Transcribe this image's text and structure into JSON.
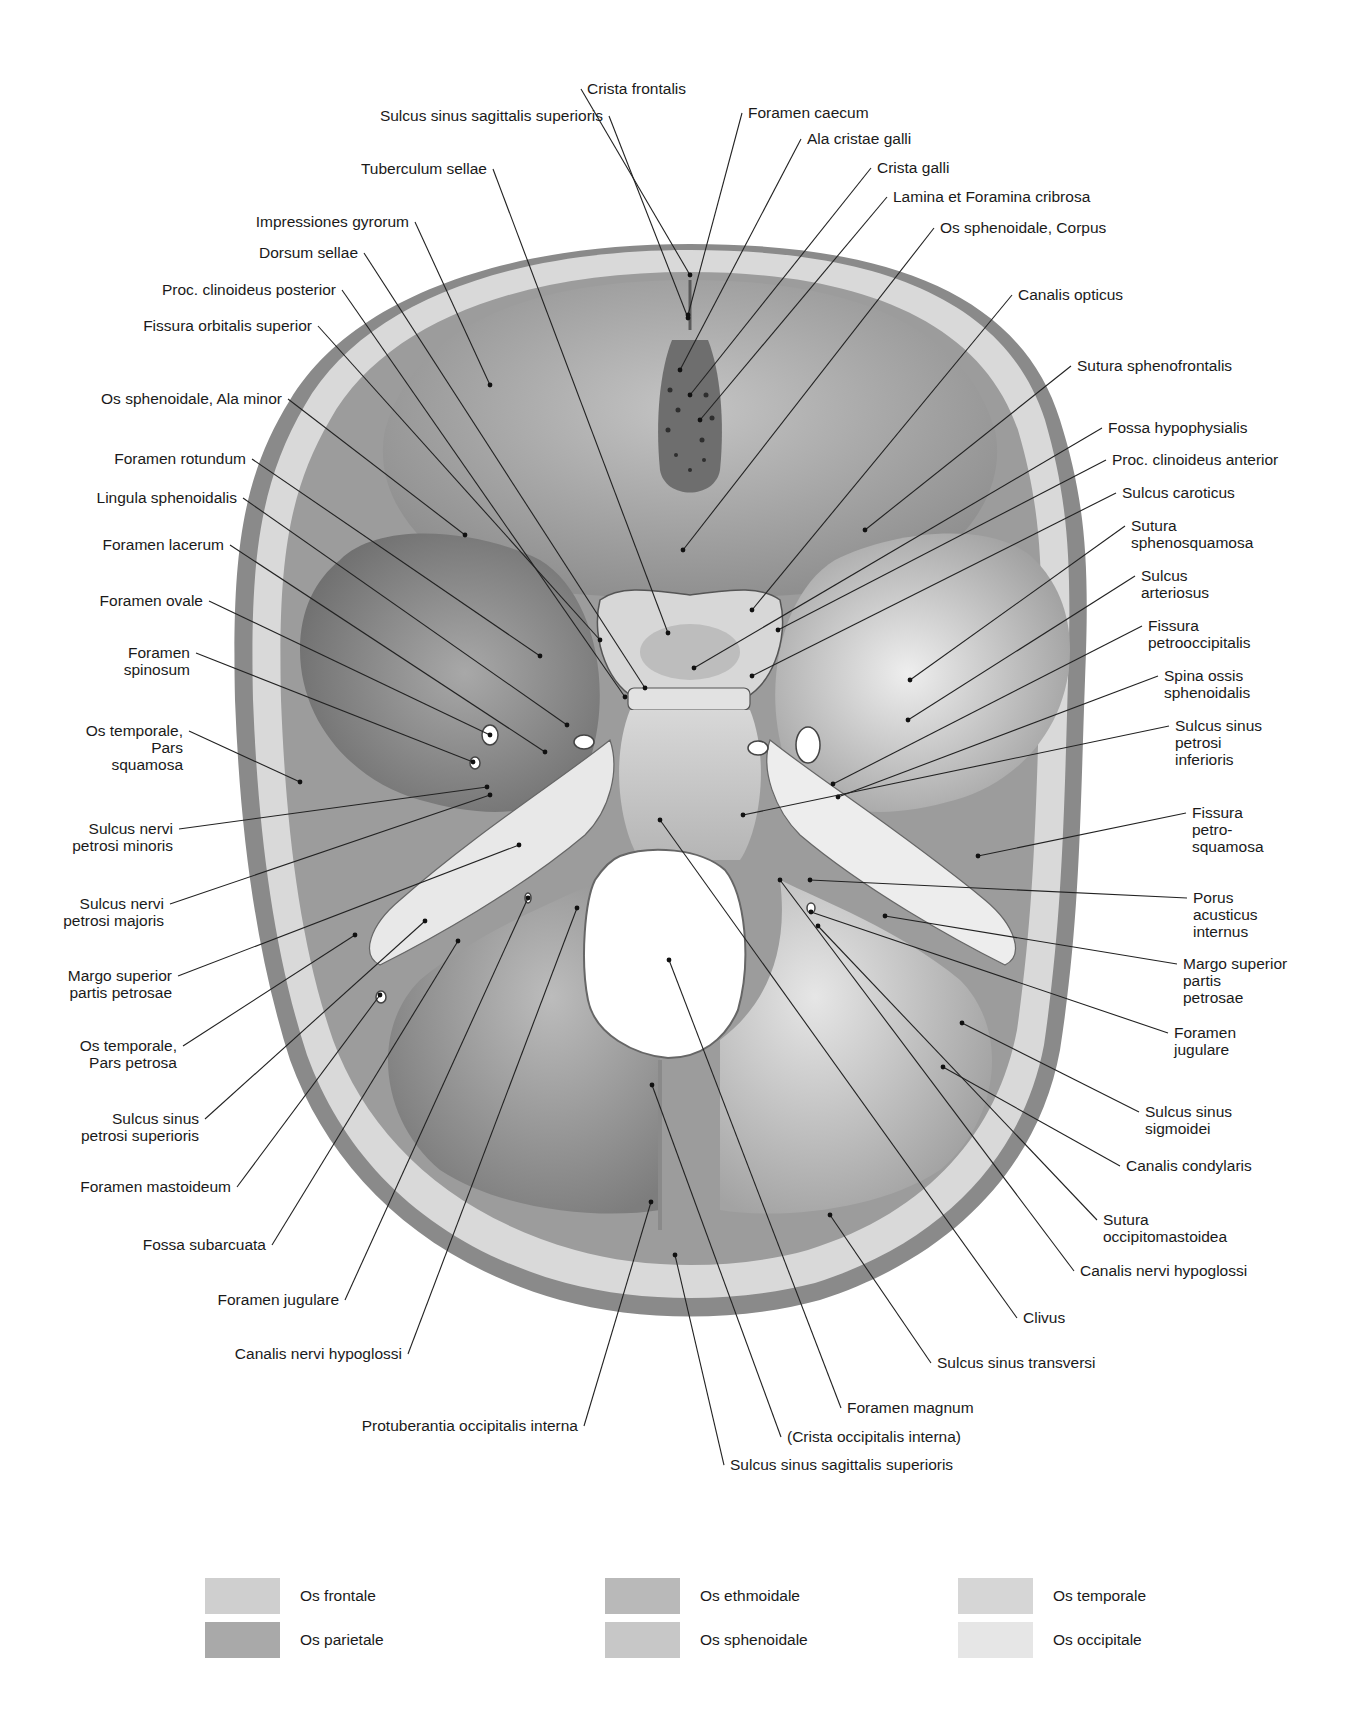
{
  "figure": {
    "labels_left": [
      {
        "id": "sulcus-sinus-sagittalis-superioris-top",
        "text": "Sulcus sinus sagittalis superioris",
        "x": 603,
        "y": 116,
        "tx": 688,
        "ty": 318
      },
      {
        "id": "tuberculum-sellae",
        "text": "Tuberculum sellae",
        "x": 487,
        "y": 169,
        "tx": 668,
        "ty": 633
      },
      {
        "id": "impressiones-gyrorum",
        "text": "Impressiones gyrorum",
        "x": 409,
        "y": 222,
        "tx": 490,
        "ty": 385
      },
      {
        "id": "dorsum-sellae",
        "text": "Dorsum sellae",
        "x": 358,
        "y": 253,
        "tx": 645,
        "ty": 688
      },
      {
        "id": "proc-clinoideus-posterior",
        "text": "Proc. clinoideus posterior",
        "x": 336,
        "y": 290,
        "tx": 625,
        "ty": 697
      },
      {
        "id": "fissura-orbitalis-superior",
        "text": "Fissura orbitalis superior",
        "x": 312,
        "y": 326,
        "tx": 600,
        "ty": 640
      },
      {
        "id": "os-sphenoidale-ala-minor",
        "text": "Os sphenoidale, Ala minor",
        "x": 282,
        "y": 399,
        "tx": 465,
        "ty": 535
      },
      {
        "id": "foramen-rotundum",
        "text": "Foramen rotundum",
        "x": 246,
        "y": 459,
        "tx": 540,
        "ty": 656
      },
      {
        "id": "lingula-sphenoidalis",
        "text": "Lingula sphenoidalis",
        "x": 237,
        "y": 498,
        "tx": 567,
        "ty": 725
      },
      {
        "id": "foramen-lacerum",
        "text": "Foramen lacerum",
        "x": 224,
        "y": 545,
        "tx": 545,
        "ty": 752
      },
      {
        "id": "foramen-ovale",
        "text": "Foramen ovale",
        "x": 203,
        "y": 601,
        "tx": 490,
        "ty": 735
      },
      {
        "id": "foramen-spinosum",
        "text": "Foramen\nspinosum",
        "x": 190,
        "y": 653,
        "tx": 473,
        "ty": 762
      },
      {
        "id": "os-temporale-pars-squamosa",
        "text": "Os temporale,\nPars\nsquamosa",
        "x": 183,
        "y": 731,
        "tx": 300,
        "ty": 782
      },
      {
        "id": "sulcus-nervi-petrosi-minoris",
        "text": "Sulcus nervi\npetrosi minoris",
        "x": 173,
        "y": 829,
        "tx": 487,
        "ty": 787
      },
      {
        "id": "sulcus-nervi-petrosi-majoris",
        "text": "Sulcus nervi\npetrosi majoris",
        "x": 164,
        "y": 904,
        "tx": 490,
        "ty": 795
      },
      {
        "id": "margo-superior-partis-petrosae-left",
        "text": "Margo superior\npartis petrosae",
        "x": 172,
        "y": 976,
        "tx": 519,
        "ty": 845
      },
      {
        "id": "os-temporale-pars-petrosa",
        "text": "Os temporale,\nPars petrosa",
        "x": 177,
        "y": 1046,
        "tx": 355,
        "ty": 935
      },
      {
        "id": "sulcus-sinus-petrosi-superioris",
        "text": "Sulcus sinus\npetrosi superioris",
        "x": 199,
        "y": 1119,
        "tx": 425,
        "ty": 921
      },
      {
        "id": "foramen-mastoideum",
        "text": "Foramen mastoideum",
        "x": 231,
        "y": 1187,
        "tx": 380,
        "ty": 995
      },
      {
        "id": "fossa-subarcuata",
        "text": "Fossa subarcuata",
        "x": 266,
        "y": 1245,
        "tx": 458,
        "ty": 941
      },
      {
        "id": "foramen-jugulare-left",
        "text": "Foramen jugulare",
        "x": 339,
        "y": 1300,
        "tx": 528,
        "ty": 898
      },
      {
        "id": "canalis-nervi-hypoglossi-left",
        "text": "Canalis nervi hypoglossi",
        "x": 402,
        "y": 1354,
        "tx": 577,
        "ty": 908
      },
      {
        "id": "protuberantia-occipitalis-interna",
        "text": "Protuberantia occipitalis interna",
        "x": 578,
        "y": 1426,
        "tx": 651,
        "ty": 1202
      }
    ],
    "labels_right": [
      {
        "id": "crista-frontalis",
        "text": "Crista frontalis",
        "x": 587,
        "y": 89,
        "tx": 690,
        "ty": 275
      },
      {
        "id": "foramen-caecum",
        "text": "Foramen caecum",
        "x": 748,
        "y": 113,
        "tx": 688,
        "ty": 315
      },
      {
        "id": "ala-cristae-galli",
        "text": "Ala cristae galli",
        "x": 807,
        "y": 139,
        "tx": 680,
        "ty": 370
      },
      {
        "id": "crista-galli",
        "text": "Crista galli",
        "x": 877,
        "y": 168,
        "tx": 690,
        "ty": 395
      },
      {
        "id": "lamina-et-foramina-cribrosa",
        "text": "Lamina et Foramina cribrosa",
        "x": 893,
        "y": 197,
        "tx": 700,
        "ty": 420
      },
      {
        "id": "os-sphenoidale-corpus",
        "text": "Os sphenoidale, Corpus",
        "x": 940,
        "y": 228,
        "tx": 683,
        "ty": 550
      },
      {
        "id": "canalis-opticus",
        "text": "Canalis opticus",
        "x": 1018,
        "y": 295,
        "tx": 752,
        "ty": 610
      },
      {
        "id": "sutura-sphenofrontalis",
        "text": "Sutura sphenofrontalis",
        "x": 1077,
        "y": 366,
        "tx": 865,
        "ty": 530
      },
      {
        "id": "fossa-hypophysialis",
        "text": "Fossa hypophysialis",
        "x": 1108,
        "y": 428,
        "tx": 694,
        "ty": 668
      },
      {
        "id": "proc-clinoideus-anterior",
        "text": "Proc. clinoideus anterior",
        "x": 1112,
        "y": 460,
        "tx": 778,
        "ty": 630
      },
      {
        "id": "sulcus-caroticus",
        "text": "Sulcus caroticus",
        "x": 1122,
        "y": 493,
        "tx": 752,
        "ty": 676
      },
      {
        "id": "sutura-sphenosquamosa",
        "text": "Sutura\nsphenosquamosa",
        "x": 1131,
        "y": 526,
        "tx": 910,
        "ty": 680
      },
      {
        "id": "sulcus-arteriosus",
        "text": "Sulcus\narteriosus",
        "x": 1141,
        "y": 576,
        "tx": 908,
        "ty": 720
      },
      {
        "id": "fissura-petrooccipitalis",
        "text": "Fissura\npetrooccipitalis",
        "x": 1148,
        "y": 626,
        "tx": 833,
        "ty": 784
      },
      {
        "id": "spina-ossis-sphenoidalis",
        "text": "Spina ossis\nsphenoidalis",
        "x": 1164,
        "y": 676,
        "tx": 838,
        "ty": 797
      },
      {
        "id": "sulcus-sinus-petrosi-inferioris",
        "text": "Sulcus sinus\npetrosi\ninferioris",
        "x": 1175,
        "y": 726,
        "tx": 743,
        "ty": 815
      },
      {
        "id": "fissura-petrosquamosa",
        "text": "Fissura\npetro-\nsquamosa",
        "x": 1192,
        "y": 813,
        "tx": 978,
        "ty": 856
      },
      {
        "id": "porus-acusticus-internus",
        "text": "Porus\nacusticus\ninternus",
        "x": 1193,
        "y": 898,
        "tx": 810,
        "ty": 880
      },
      {
        "id": "margo-superior-partis-petrosae-right",
        "text": "Margo superior\npartis\npetrosae",
        "x": 1183,
        "y": 964,
        "tx": 885,
        "ty": 916
      },
      {
        "id": "foramen-jugulare-right",
        "text": "Foramen\njugulare",
        "x": 1174,
        "y": 1033,
        "tx": 811,
        "ty": 912
      },
      {
        "id": "sulcus-sinus-sigmoidei",
        "text": "Sulcus sinus\nsigmoidei",
        "x": 1145,
        "y": 1112,
        "tx": 962,
        "ty": 1023
      },
      {
        "id": "canalis-condylaris",
        "text": "Canalis condylaris",
        "x": 1126,
        "y": 1166,
        "tx": 943,
        "ty": 1067
      },
      {
        "id": "sutura-occipitomastoidea",
        "text": "Sutura\noccipitomastoidea",
        "x": 1103,
        "y": 1220,
        "tx": 818,
        "ty": 926
      },
      {
        "id": "canalis-nervi-hypoglossi-right",
        "text": "Canalis nervi hypoglossi",
        "x": 1080,
        "y": 1271,
        "tx": 780,
        "ty": 880
      },
      {
        "id": "clivus",
        "text": "Clivus",
        "x": 1023,
        "y": 1318,
        "tx": 660,
        "ty": 820
      },
      {
        "id": "sulcus-sinus-transversi",
        "text": "Sulcus sinus transversi",
        "x": 937,
        "y": 1363,
        "tx": 830,
        "ty": 1215
      },
      {
        "id": "foramen-magnum",
        "text": "Foramen magnum",
        "x": 847,
        "y": 1408,
        "tx": 669,
        "ty": 960
      },
      {
        "id": "crista-occipitalis-interna",
        "text": "(Crista occipitalis interna)",
        "x": 787,
        "y": 1437,
        "tx": 652,
        "ty": 1085
      },
      {
        "id": "sulcus-sinus-sagittalis-superioris-bottom",
        "text": "Sulcus sinus sagittalis superioris",
        "x": 730,
        "y": 1465,
        "tx": 675,
        "ty": 1255
      }
    ]
  },
  "legend": {
    "items": [
      {
        "label": "Os frontale",
        "color": "#cfcfcf",
        "x": 205,
        "y": 1578
      },
      {
        "label": "Os parietale",
        "color": "#a9a9a9",
        "x": 205,
        "y": 1622
      },
      {
        "label": "Os ethmoidale",
        "color": "#b9b9b9",
        "x": 605,
        "y": 1578
      },
      {
        "label": "Os sphenoidale",
        "color": "#c7c7c7",
        "x": 605,
        "y": 1622
      },
      {
        "label": "Os temporale",
        "color": "#d6d6d6",
        "x": 958,
        "y": 1578
      },
      {
        "label": "Os occipitale",
        "color": "#e6e6e6",
        "x": 958,
        "y": 1622
      }
    ]
  },
  "colors": {
    "background": "#ffffff",
    "text": "#1a1a1a",
    "leader_line": "#222222",
    "bone_outer": "#b8b8b8",
    "diploe": "#dcdcdc",
    "fossa_dark": "#8c8c8c",
    "fossa_mid": "#a6a6a6",
    "fossa_light": "#cdcdcd",
    "petrous": "#e4e4e4",
    "foramen": "#ffffff"
  }
}
